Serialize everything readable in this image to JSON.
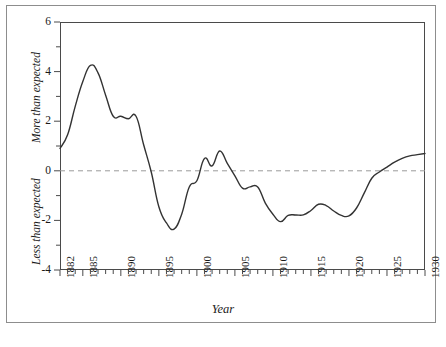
{
  "chart_data": {
    "type": "line",
    "title": "",
    "xlabel": "Year",
    "ylabel_upper": "More than expected",
    "ylabel_lower": "Less than expected",
    "xlim": [
      1882,
      1930
    ],
    "ylim": [
      -4,
      6
    ],
    "yticks": [
      6,
      4,
      2,
      0,
      -2,
      -4
    ],
    "ytick_labels": [
      "6",
      "4",
      "2",
      "0",
      "-2",
      "-4"
    ],
    "xticks": [
      1882,
      1885,
      1890,
      1895,
      1900,
      1905,
      1910,
      1915,
      1920,
      1925,
      1930
    ],
    "xtick_labels": [
      "1882",
      "1885",
      "1890",
      "1895",
      "1900",
      "1905",
      "1910",
      "1915",
      "1920",
      "1925",
      "1930"
    ],
    "minor_xticks_every": 1,
    "grid": false,
    "legend": "none",
    "zero_reference_line": {
      "value": 0,
      "style": "dashed",
      "color": "#9a9a9a"
    },
    "line_color": "#333333",
    "line_width": 1.4,
    "series": [
      {
        "name": "deviation",
        "x": [
          1882,
          1883,
          1884,
          1885,
          1886,
          1887,
          1888,
          1889,
          1890,
          1891,
          1892,
          1893,
          1894,
          1895,
          1896,
          1897,
          1898,
          1899,
          1900,
          1901,
          1902,
          1903,
          1904,
          1905,
          1906,
          1907,
          1908,
          1909,
          1910,
          1911,
          1912,
          1913,
          1914,
          1915,
          1916,
          1917,
          1918,
          1919,
          1920,
          1921,
          1922,
          1923,
          1924,
          1925,
          1926,
          1927,
          1928,
          1929,
          1930
        ],
        "values": [
          0.9,
          1.45,
          2.6,
          3.6,
          4.25,
          3.95,
          3.05,
          2.2,
          2.2,
          2.1,
          2.2,
          1.05,
          -0.05,
          -1.45,
          -2.1,
          -2.35,
          -1.75,
          -0.65,
          -0.4,
          0.5,
          0.2,
          0.8,
          0.3,
          -0.2,
          -0.7,
          -0.65,
          -0.65,
          -1.3,
          -1.75,
          -2.05,
          -1.8,
          -1.78,
          -1.78,
          -1.6,
          -1.35,
          -1.4,
          -1.62,
          -1.8,
          -1.82,
          -1.5,
          -0.9,
          -0.3,
          -0.05,
          0.15,
          0.35,
          0.5,
          0.6,
          0.65,
          0.7
        ]
      }
    ]
  },
  "axis": {
    "y_upper_label": "More than expected",
    "y_lower_label": "Less than expected",
    "x_label": "Year"
  }
}
